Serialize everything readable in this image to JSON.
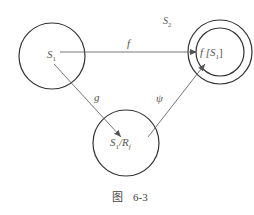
{
  "diagram": {
    "nodes": {
      "s1": {
        "label": "S",
        "sub": "1"
      },
      "s2": {
        "label": "S",
        "sub": "2"
      },
      "fs1": {
        "label": "f [S",
        "sub": "1",
        "close": "]"
      },
      "quotient": {
        "label": "S",
        "sub": "1",
        "mid": "/R",
        "sub2": "f"
      }
    },
    "edges": {
      "f": "f",
      "g": "g",
      "psi": "ψ"
    },
    "caption": {
      "prefix": "图",
      "number": "6-3"
    }
  }
}
